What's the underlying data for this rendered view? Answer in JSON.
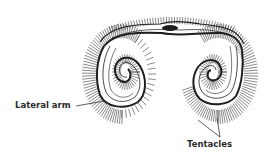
{
  "diagram": {
    "labels": {
      "lateral_arm": "Lateral arm",
      "tentacles": "Tentacles"
    },
    "colors": {
      "ink": "#1e1e1e",
      "background": "#ffffff"
    }
  }
}
